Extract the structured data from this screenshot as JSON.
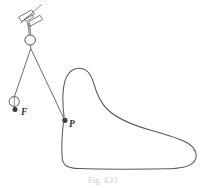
{
  "figure": {
    "caption": "Fig. 4.12",
    "stroke_color": "#5a5a60",
    "dot_color": "#3a3a3a",
    "background_color": "#ffffff",
    "width": 206,
    "height": 188
  },
  "labels": {
    "force_point": "F",
    "contact_point": "P"
  },
  "parts": {
    "clamp": "clamp-bracket",
    "upper_ring": "pulley-ring",
    "lower_ring": "weight-ring",
    "left_string": "string-to-F",
    "right_string": "string-to-P",
    "profile": "closed-cam-curve",
    "stem": "clamp-stem"
  }
}
